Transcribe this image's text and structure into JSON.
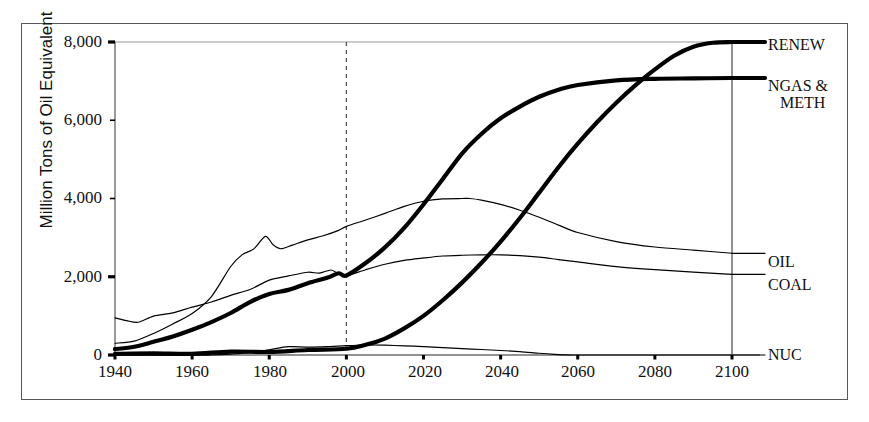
{
  "chart_data": {
    "type": "line",
    "title": "",
    "xlabel": "",
    "ylabel": "Million Tons of Oil Equivalent",
    "xlim": [
      1940,
      2100
    ],
    "ylim": [
      0,
      8000
    ],
    "xticks": [
      1940,
      1960,
      1980,
      2000,
      2020,
      2040,
      2060,
      2080,
      2100
    ],
    "yticks": [
      0,
      2000,
      4000,
      6000,
      8000
    ],
    "ytick_labels": [
      "0",
      "2,000",
      "4,000",
      "6,000",
      "8,000"
    ],
    "grid": "single horizontal gridline at 8000",
    "legend_position": "right-of-axes",
    "annotations": [
      {
        "name": "present-day-marker",
        "type": "vertical-dashed-line",
        "x": 2000
      },
      {
        "name": "end-of-projection-marker",
        "type": "vertical-solid-line",
        "x": 2100
      }
    ],
    "series": [
      {
        "name": "RENEW",
        "label": "RENEW",
        "style": "thick",
        "x": [
          1940,
          1950,
          1960,
          1970,
          1980,
          1990,
          2000,
          2005,
          2010,
          2015,
          2020,
          2025,
          2030,
          2035,
          2040,
          2045,
          2050,
          2055,
          2060,
          2065,
          2070,
          2075,
          2080,
          2085,
          2090,
          2095,
          2100
        ],
        "values": [
          30,
          40,
          50,
          70,
          95,
          130,
          180,
          260,
          420,
          680,
          1000,
          1400,
          1850,
          2350,
          2900,
          3500,
          4150,
          4800,
          5400,
          5950,
          6450,
          6900,
          7300,
          7650,
          7880,
          7980,
          8000
        ]
      },
      {
        "name": "NGAS & METH",
        "label": "NGAS & METH",
        "style": "thick",
        "x": [
          1940,
          1945,
          1950,
          1955,
          1960,
          1965,
          1970,
          1975,
          1980,
          1985,
          1990,
          1995,
          1998,
          2000,
          2005,
          2010,
          2015,
          2020,
          2025,
          2030,
          2035,
          2040,
          2045,
          2050,
          2055,
          2060,
          2070,
          2080,
          2090,
          2100
        ],
        "values": [
          150,
          200,
          320,
          470,
          640,
          840,
          1090,
          1340,
          1560,
          1680,
          1850,
          1980,
          2100,
          2050,
          2350,
          2750,
          3250,
          3850,
          4500,
          5150,
          5650,
          6050,
          6350,
          6600,
          6780,
          6900,
          7020,
          7060,
          7070,
          7080
        ]
      },
      {
        "name": "OIL",
        "label": "OIL",
        "style": "thin",
        "x": [
          1940,
          1945,
          1950,
          1955,
          1960,
          1965,
          1970,
          1973,
          1976,
          1979,
          1981,
          1983,
          1986,
          1990,
          1994,
          1998,
          2000,
          2005,
          2010,
          2015,
          2020,
          2025,
          2030,
          2032,
          2035,
          2040,
          2045,
          2050,
          2055,
          2060,
          2070,
          2080,
          2090,
          2100
        ],
        "values": [
          300,
          360,
          560,
          800,
          1080,
          1500,
          2250,
          2600,
          2750,
          3050,
          2820,
          2700,
          2780,
          2980,
          3080,
          3220,
          3300,
          3450,
          3620,
          3800,
          3930,
          3990,
          4000,
          4000,
          3960,
          3850,
          3700,
          3520,
          3320,
          3130,
          2900,
          2760,
          2680,
          2600
        ]
      },
      {
        "name": "COAL",
        "label": "COAL",
        "style": "thin",
        "x": [
          1940,
          1943,
          1946,
          1950,
          1955,
          1960,
          1965,
          1970,
          1975,
          1980,
          1985,
          1990,
          1993,
          1996,
          1998,
          2000,
          2005,
          2010,
          2015,
          2020,
          2025,
          2030,
          2035,
          2040,
          2045,
          2050,
          2055,
          2060,
          2070,
          2080,
          2090,
          2100
        ],
        "values": [
          950,
          880,
          840,
          980,
          1100,
          1250,
          1320,
          1500,
          1700,
          1900,
          2020,
          2150,
          2090,
          2150,
          2080,
          2060,
          2180,
          2320,
          2420,
          2480,
          2530,
          2550,
          2560,
          2560,
          2540,
          2500,
          2440,
          2380,
          2260,
          2180,
          2120,
          2060
        ]
      },
      {
        "name": "NUC",
        "label": "NUC",
        "style": "thin",
        "x": [
          1940,
          1960,
          1965,
          1970,
          1975,
          1980,
          1985,
          1990,
          1995,
          2000,
          2005,
          2010,
          2015,
          2020,
          2025,
          2030,
          2035,
          2040,
          2045,
          2050,
          2054,
          2058
        ],
        "values": [
          0,
          0,
          10,
          30,
          80,
          140,
          200,
          235,
          250,
          255,
          255,
          250,
          235,
          215,
          190,
          165,
          140,
          115,
          88,
          45,
          18,
          0
        ]
      }
    ]
  },
  "axes": {
    "ylabel": "Million Tons of Oil Equivalent",
    "ytick_labels": [
      "8,000",
      "6,000",
      "4,000",
      "2,000",
      "0"
    ],
    "xtick_labels": [
      "1940",
      "1960",
      "1980",
      "2000",
      "2020",
      "2040",
      "2060",
      "2080",
      "2100"
    ]
  },
  "legend": {
    "items": [
      {
        "label": "RENEW",
        "line2": ""
      },
      {
        "label": "NGAS &",
        "line2": "METH"
      },
      {
        "label": "OIL",
        "line2": ""
      },
      {
        "label": "COAL",
        "line2": ""
      },
      {
        "label": "NUC",
        "line2": ""
      }
    ]
  },
  "colors": {
    "line": "#000000",
    "frame": "#58585a",
    "axis": "#6e6e70",
    "grid": "#9a9a9c",
    "text": "#111111"
  }
}
